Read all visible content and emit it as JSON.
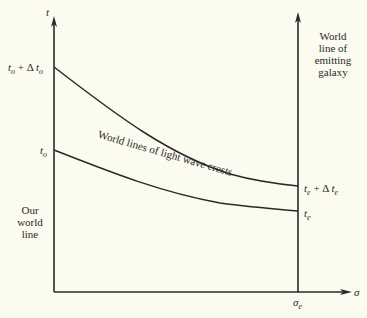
{
  "diagram": {
    "axes": {
      "vertical_label": "t",
      "horizontal_label": "σ",
      "right_axis_tick": "σ",
      "right_axis_tick_sub": "e"
    },
    "left_labels": {
      "t0_plus_dt0": {
        "t": "t",
        "sub1": "o",
        "plus": "+ Δ",
        "t2": "t",
        "sub2": "o"
      },
      "t0": {
        "t": "t",
        "sub": "o"
      }
    },
    "right_labels": {
      "te_plus_dte": {
        "t": "t",
        "sub1": "e",
        "plus": "+ Δ",
        "t2": "t",
        "sub2": "e"
      },
      "te": {
        "t": "t",
        "sub": "e"
      }
    },
    "our_world_line": [
      "Our",
      "world",
      "line"
    ],
    "emitting_galaxy": [
      "World",
      "line of",
      "emitting",
      "galaxy"
    ],
    "curve_label": "World lines of light  wave crests",
    "colors": {
      "ink": "#2a2a28",
      "paper": "#fbfbf0"
    }
  }
}
